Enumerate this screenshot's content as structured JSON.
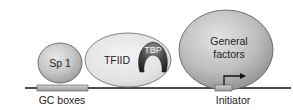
{
  "diagram": {
    "type": "promoter-transcription-factor-assembly",
    "proteins": [
      {
        "id": "sp1",
        "label": "Sp 1"
      },
      {
        "id": "tfiid",
        "label": "TFIID"
      },
      {
        "id": "tbp",
        "label": "TBP"
      },
      {
        "id": "general_factors",
        "label_line1": "General",
        "label_line2": "factors"
      }
    ],
    "dna_elements": [
      {
        "id": "gc_boxes",
        "label": "GC boxes"
      },
      {
        "id": "initiator",
        "label": "Initiator"
      }
    ],
    "colors": {
      "protein_fill": "#c8c8c8",
      "protein_stroke": "#555555",
      "tfiid_fill": "#e6e6e6",
      "tbp_fill": "#3a3a3a",
      "dna_line": "#111111",
      "element_box": "#b5b5b5"
    }
  }
}
